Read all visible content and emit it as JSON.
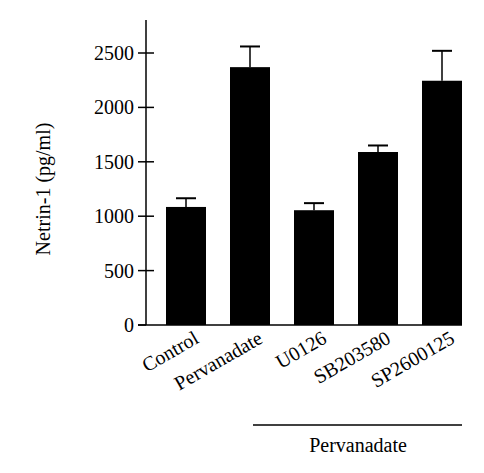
{
  "chart_data": {
    "type": "bar",
    "title": "",
    "xlabel": "",
    "ylabel": "Netrin-1 (pg/ml)",
    "ylim": [
      0,
      2500
    ],
    "yticks": [
      0,
      500,
      1000,
      1500,
      2000,
      2500
    ],
    "ytick_labels": [
      "0",
      "500",
      "1000",
      "1500",
      "2000",
      "2500"
    ],
    "grid": false,
    "legend": null,
    "categories": [
      "Control",
      "Pervanadate",
      "U0126",
      "SB203580",
      "SP2600125"
    ],
    "values": [
      1085,
      2370,
      1055,
      1590,
      2245
    ],
    "error_bars": [
      80,
      190,
      65,
      60,
      275
    ],
    "bar_color": "#000000",
    "group_annotation": {
      "label": "Pervanadate",
      "spans_categories": [
        "U0126",
        "SB203580",
        "SP2600125"
      ]
    }
  }
}
